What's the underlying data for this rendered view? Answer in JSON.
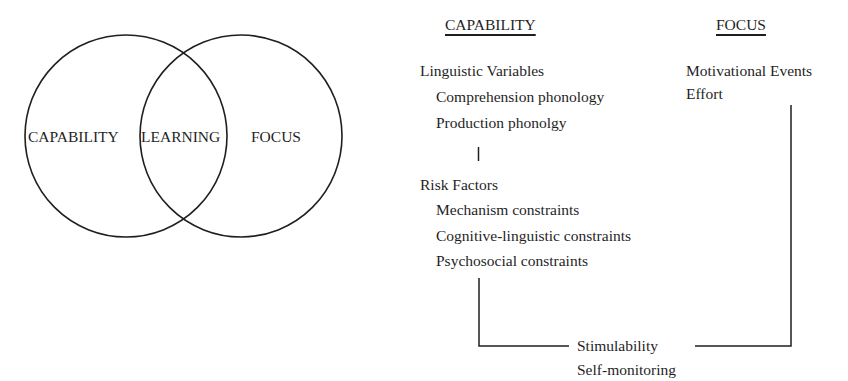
{
  "venn": {
    "left_circle_label": "CAPABILITY",
    "intersection_label": "LEARNING",
    "right_circle_label": "FOCUS"
  },
  "capability_column": {
    "header": "CAPABILITY",
    "groups": [
      {
        "title": "Linguistic Variables",
        "items": [
          "Comprehension phonology",
          "Production phonolgy"
        ]
      },
      {
        "title": "Risk Factors",
        "items": [
          "Mechanism constraints",
          "Cognitive-linguistic constraints",
          "Psychosocial constraints"
        ]
      }
    ]
  },
  "focus_column": {
    "header": "FOCUS",
    "items": [
      "Motivational Events",
      "Effort"
    ]
  },
  "convergence": {
    "items": [
      "Stimulability",
      "Self-monitoring"
    ]
  },
  "colors": {
    "ink": "#1f1f1f",
    "background": "#ffffff"
  }
}
